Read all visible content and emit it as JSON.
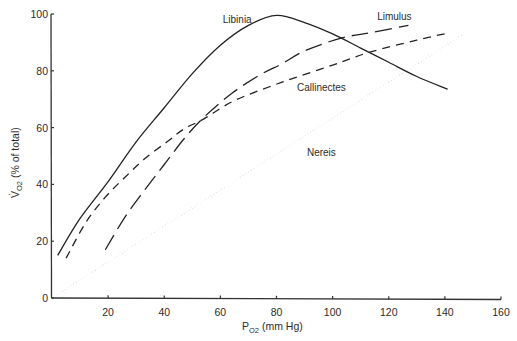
{
  "chart_data": {
    "type": "line",
    "title": "",
    "xlabel": "PO2 (mm Hg)",
    "xlabel_main": "P",
    "xlabel_sub": "O2",
    "xlabel_rest": " (mm Hg)",
    "ylabel": "V̇O2 (% of total)",
    "ylabel_main": "V̇",
    "ylabel_sub": "O2",
    "ylabel_rest": " (% of total)",
    "xlim": [
      0,
      160
    ],
    "ylim": [
      0,
      100
    ],
    "xticks": [
      20,
      40,
      60,
      80,
      100,
      120,
      140,
      160
    ],
    "xtick_labels": [
      "20",
      "40",
      "60",
      "80",
      "100",
      "120",
      "140",
      "160"
    ],
    "yticks": [
      0,
      20,
      40,
      60,
      80,
      100
    ],
    "ytick_labels": [
      "0",
      "20",
      "40",
      "60",
      "80",
      "100"
    ],
    "grid": false,
    "legend": "inline labels",
    "series": [
      {
        "name": "Libinia",
        "style": "solid",
        "x": [
          2,
          10,
          20,
          30,
          40,
          50,
          60,
          70,
          80,
          90,
          100,
          110,
          120,
          130,
          141
        ],
        "y": [
          15,
          28,
          41,
          55,
          67,
          79,
          89,
          96,
          99.5,
          97,
          93,
          88,
          83,
          78,
          73.5
        ]
      },
      {
        "name": "Limulus",
        "style": "long-dash",
        "x": [
          19,
          26,
          33,
          40,
          47,
          54,
          64,
          74,
          82,
          90,
          103,
          114,
          127
        ],
        "y": [
          17,
          28.5,
          38,
          47,
          56,
          63.5,
          72,
          78.5,
          82.5,
          87,
          91.5,
          93.5,
          96
        ]
      },
      {
        "name": "Callinectes",
        "style": "short-dash",
        "x": [
          5,
          12,
          19,
          26,
          33,
          41,
          47,
          54,
          65,
          82,
          100,
          113,
          130,
          142
        ],
        "y": [
          14,
          26.5,
          35.5,
          42.5,
          49,
          55,
          59.5,
          63,
          69.5,
          76,
          82,
          86.5,
          90.8,
          93.5
        ]
      },
      {
        "name": "Nereis",
        "style": "dotted",
        "x": [
          0,
          146
        ],
        "y": [
          0,
          92.5
        ]
      }
    ],
    "annotations": [
      {
        "text": "Libinia",
        "x": 66,
        "y": 97
      },
      {
        "text": "Limulus",
        "x": 122,
        "y": 98
      },
      {
        "text": "Callinectes",
        "x": 96,
        "y": 73
      },
      {
        "text": "Nereis",
        "x": 96,
        "y": 50
      }
    ]
  }
}
